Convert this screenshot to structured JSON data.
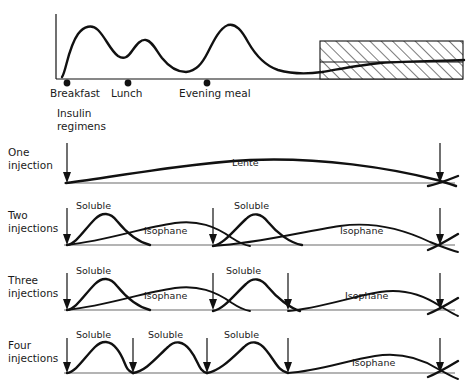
{
  "figure": {
    "caption": "Fig. 9.1   Insulin and different insulin regimens",
    "caption_visible": false
  },
  "top_chart": {
    "name": "physiological-insulin-profile",
    "meals": [
      {
        "label": "Breakfast",
        "x": 67
      },
      {
        "label": "Lunch",
        "x": 128
      },
      {
        "label": "Evening meal",
        "x": 207
      }
    ],
    "normal_range_band": {
      "label": "",
      "x": 320,
      "width": 143
    }
  },
  "section_heading": {
    "line1": "Insulin",
    "line2": "regimens"
  },
  "regimens": [
    {
      "id": "one-injection",
      "label_line1": "One",
      "label_line2": "injection",
      "arrows": [
        67,
        440
      ],
      "insulin_labels": [
        {
          "text": "Lente",
          "x": 250
        }
      ]
    },
    {
      "id": "two-injections",
      "label_line1": "Two",
      "label_line2": "injections",
      "arrows": [
        67,
        213,
        440
      ],
      "insulin_labels": [
        {
          "text": "Soluble",
          "x": 100
        },
        {
          "text": "Isophane",
          "x": 150
        },
        {
          "text": "Soluble",
          "x": 262
        },
        {
          "text": "Isophane",
          "x": 345
        }
      ]
    },
    {
      "id": "three-injections",
      "label_line1": "Three",
      "label_line2": "injections",
      "arrows": [
        67,
        213,
        288,
        440
      ],
      "insulin_labels": [
        {
          "text": "Soluble",
          "x": 100
        },
        {
          "text": "Isophane",
          "x": 150
        },
        {
          "text": "Soluble",
          "x": 250
        },
        {
          "text": "Isophane",
          "x": 350
        }
      ]
    },
    {
      "id": "four-injections",
      "label_line1": "Four",
      "label_line2": "injections",
      "arrows": [
        67,
        133,
        207,
        288,
        440
      ],
      "insulin_labels": [
        {
          "text": "Soluble",
          "x": 100
        },
        {
          "text": "Soluble",
          "x": 172
        },
        {
          "text": "Soluble",
          "x": 248
        },
        {
          "text": "Isophane",
          "x": 360
        }
      ]
    }
  ],
  "colors": {
    "ink": "#111111",
    "baseline": "#6b6b6b",
    "paper": "#ffffff"
  }
}
